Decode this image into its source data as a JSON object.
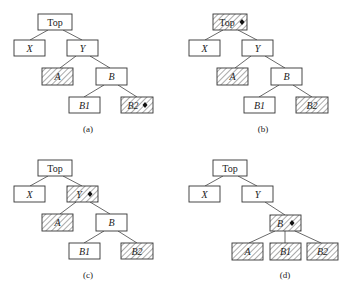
{
  "figure": {
    "panels": [
      {
        "id": "a",
        "caption": "(a)",
        "offset": [
          0,
          0
        ],
        "nodes": [
          {
            "id": "top",
            "label": "Top",
            "italic": false,
            "hatched": false,
            "marked": false
          },
          {
            "id": "x",
            "label": "X",
            "italic": true,
            "hatched": false,
            "marked": false
          },
          {
            "id": "y",
            "label": "Y",
            "italic": true,
            "hatched": false,
            "marked": false
          },
          {
            "id": "a",
            "label": "A",
            "italic": true,
            "hatched": true,
            "marked": false
          },
          {
            "id": "b",
            "label": "B",
            "italic": true,
            "hatched": false,
            "marked": false
          },
          {
            "id": "b1",
            "label": "B1",
            "italic": true,
            "hatched": false,
            "marked": false
          },
          {
            "id": "b2",
            "label": "B2",
            "italic": true,
            "hatched": true,
            "marked": true
          }
        ],
        "edges": [
          [
            "top",
            "x"
          ],
          [
            "top",
            "y"
          ],
          [
            "y",
            "a"
          ],
          [
            "y",
            "b"
          ],
          [
            "b",
            "b1"
          ],
          [
            "b",
            "b2"
          ]
        ]
      },
      {
        "id": "b",
        "caption": "(b)",
        "offset": [
          175,
          0
        ],
        "nodes": [
          {
            "id": "top",
            "label": "Top",
            "italic": false,
            "hatched": true,
            "marked": true
          },
          {
            "id": "x",
            "label": "X",
            "italic": true,
            "hatched": false,
            "marked": false
          },
          {
            "id": "y",
            "label": "Y",
            "italic": true,
            "hatched": false,
            "marked": false
          },
          {
            "id": "a",
            "label": "A",
            "italic": true,
            "hatched": true,
            "marked": false
          },
          {
            "id": "b",
            "label": "B",
            "italic": true,
            "hatched": false,
            "marked": false
          },
          {
            "id": "b1",
            "label": "B1",
            "italic": true,
            "hatched": false,
            "marked": false
          },
          {
            "id": "b2",
            "label": "B2",
            "italic": true,
            "hatched": true,
            "marked": false
          }
        ],
        "edges": [
          [
            "top",
            "x"
          ],
          [
            "top",
            "y"
          ],
          [
            "y",
            "a"
          ],
          [
            "y",
            "b"
          ],
          [
            "b",
            "b1"
          ],
          [
            "b",
            "b2"
          ]
        ]
      },
      {
        "id": "c",
        "caption": "(c)",
        "offset": [
          0,
          146
        ],
        "nodes": [
          {
            "id": "top",
            "label": "Top",
            "italic": false,
            "hatched": false,
            "marked": false
          },
          {
            "id": "x",
            "label": "X",
            "italic": true,
            "hatched": false,
            "marked": false
          },
          {
            "id": "y",
            "label": "Y",
            "italic": true,
            "hatched": true,
            "marked": true
          },
          {
            "id": "a",
            "label": "A",
            "italic": true,
            "hatched": true,
            "marked": false
          },
          {
            "id": "b",
            "label": "B",
            "italic": true,
            "hatched": false,
            "marked": false
          },
          {
            "id": "b1",
            "label": "B1",
            "italic": true,
            "hatched": false,
            "marked": false
          },
          {
            "id": "b2",
            "label": "B2",
            "italic": true,
            "hatched": true,
            "marked": false
          }
        ],
        "edges": [
          [
            "top",
            "x"
          ],
          [
            "top",
            "y"
          ],
          [
            "y",
            "a"
          ],
          [
            "y",
            "b"
          ],
          [
            "b",
            "b1"
          ],
          [
            "b",
            "b2"
          ]
        ]
      },
      {
        "id": "d",
        "caption": "(d)",
        "offset": [
          175,
          146
        ],
        "nodes": [
          {
            "id": "top",
            "label": "Top",
            "italic": false,
            "hatched": false,
            "marked": false
          },
          {
            "id": "x",
            "label": "X",
            "italic": true,
            "hatched": false,
            "marked": false
          },
          {
            "id": "y",
            "label": "Y",
            "italic": true,
            "hatched": false,
            "marked": false
          },
          {
            "id": "b",
            "label": "B",
            "italic": true,
            "hatched": true,
            "marked": true
          },
          {
            "id": "a",
            "label": "A",
            "italic": true,
            "hatched": true,
            "marked": false
          },
          {
            "id": "b1",
            "label": "B1",
            "italic": true,
            "hatched": true,
            "marked": false
          },
          {
            "id": "b2",
            "label": "B2",
            "italic": true,
            "hatched": true,
            "marked": false
          }
        ],
        "edges": [
          [
            "top",
            "x"
          ],
          [
            "top",
            "y"
          ],
          [
            "y",
            "b"
          ],
          [
            "b",
            "a"
          ],
          [
            "b",
            "b1"
          ],
          [
            "b",
            "b2"
          ]
        ]
      }
    ]
  }
}
